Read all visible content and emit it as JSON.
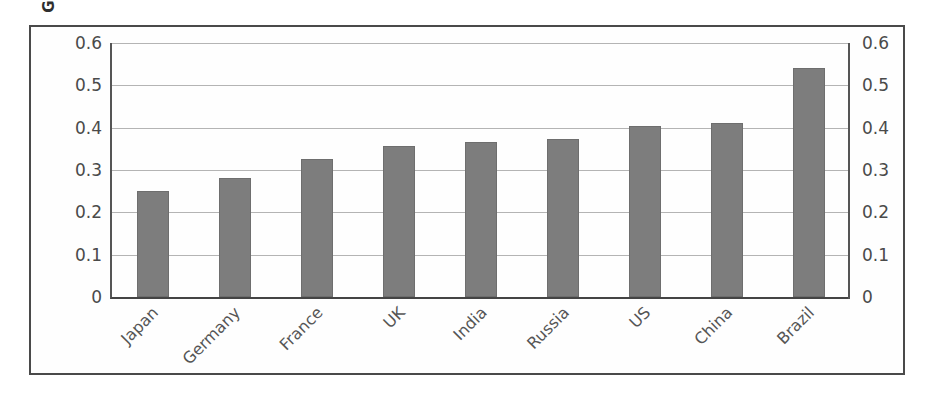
{
  "chart_data": {
    "type": "bar",
    "title": "",
    "xlabel": "",
    "ylabel": "Gini coefficient",
    "categories": [
      "Japan",
      "Germany",
      "France",
      "UK",
      "India",
      "Russia",
      "US",
      "China",
      "Brazil"
    ],
    "values": [
      0.25,
      0.28,
      0.326,
      0.357,
      0.365,
      0.374,
      0.405,
      0.41,
      0.54
    ],
    "ylim": [
      0,
      0.6
    ],
    "ytick_labels": [
      "0.6",
      "0.5",
      "0.4",
      "0.3",
      "0.2",
      "0.1",
      "0"
    ],
    "ytick_values": [
      0.6,
      0.5,
      0.4,
      0.3,
      0.2,
      0.1,
      0
    ],
    "grid": true,
    "legend": false,
    "legend_position": "none",
    "dual_y_axis": true,
    "bar_color": "#7d7d7d",
    "gridline_color": "#b4b4b4",
    "axis_color": "#555555",
    "frame_color": "#4a4a4a",
    "label_rotation": -45
  }
}
